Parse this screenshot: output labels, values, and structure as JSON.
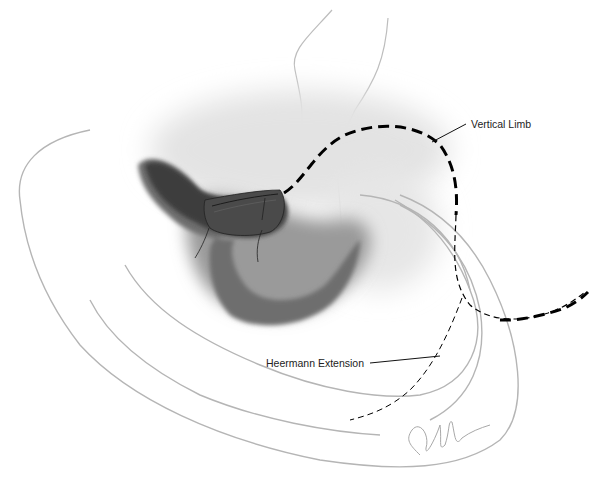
{
  "illustration": {
    "subject": "ear surgical approach illustration",
    "labels": {
      "vertical_limb": "Vertical Limb",
      "heermann_extension": "Heermann Extension"
    },
    "colors": {
      "background": "#ffffff",
      "outline": "#b8b8b8",
      "shading_dark": "#3a3a3a",
      "shading_light": "#d8d8d8",
      "incision_line": "#000000"
    }
  }
}
